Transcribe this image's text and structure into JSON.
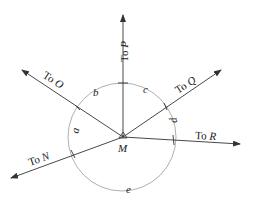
{
  "diagram": {
    "center": {
      "label": "M",
      "x": 123,
      "y": 137
    },
    "circle": {
      "cx": 122,
      "cy": 137,
      "r": 54,
      "color": "#9a9a9a"
    },
    "rays": [
      {
        "id": "P",
        "prefix": "To",
        "target": "P",
        "x2": 123,
        "y2": 15
      },
      {
        "id": "O",
        "prefix": "To",
        "target": "O",
        "x2": 22,
        "y2": 70
      },
      {
        "id": "Q",
        "prefix": "To",
        "target": "Q",
        "x2": 221,
        "y2": 70
      },
      {
        "id": "R",
        "prefix": "To",
        "target": "R",
        "x2": 240,
        "y2": 144
      },
      {
        "id": "N",
        "prefix": "To",
        "target": "N",
        "x2": 11,
        "y2": 178
      }
    ],
    "arcs": [
      {
        "label": "a"
      },
      {
        "label": "b"
      },
      {
        "label": "c"
      },
      {
        "label": "d"
      },
      {
        "label": "e"
      }
    ],
    "line_color": "#333333"
  }
}
